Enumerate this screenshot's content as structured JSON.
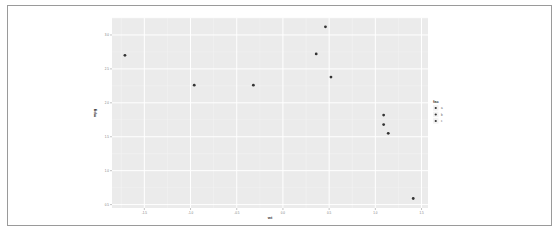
{
  "chart_data": {
    "type": "scatter",
    "title": "",
    "xlabel": "wt",
    "ylabel": "mpg",
    "xlim": [
      -1.85,
      1.57
    ],
    "ylim": [
      0.45,
      3.25
    ],
    "grid": true,
    "x_ticks": [
      -1.5,
      -1.0,
      -0.5,
      0.0,
      0.5,
      1.0,
      1.5
    ],
    "x_tick_labels": [
      "-1.5",
      "-1.0",
      "-0.5",
      "0.0",
      "0.5",
      "1.0",
      "1.5"
    ],
    "y_ticks": [
      0.5,
      1.0,
      1.5,
      2.0,
      2.5,
      3.0
    ],
    "y_tick_labels": [
      "0.5",
      "1.0",
      "1.5",
      "2.0",
      "2.5",
      "3.0"
    ],
    "legend": {
      "title": "fac",
      "placement": "right",
      "entries": [
        "a",
        "b",
        "c"
      ]
    },
    "points": [
      {
        "x": -1.71,
        "y": 2.7,
        "group": "a"
      },
      {
        "x": -0.96,
        "y": 2.26,
        "group": "a"
      },
      {
        "x": -0.32,
        "y": 2.26,
        "group": "a"
      },
      {
        "x": 0.36,
        "y": 2.72,
        "group": "a"
      },
      {
        "x": 0.46,
        "y": 3.12,
        "group": "b"
      },
      {
        "x": 0.52,
        "y": 2.38,
        "group": "a"
      },
      {
        "x": 1.09,
        "y": 1.82,
        "group": "a"
      },
      {
        "x": 1.09,
        "y": 1.68,
        "group": "a"
      },
      {
        "x": 1.14,
        "y": 1.55,
        "group": "b"
      },
      {
        "x": 1.41,
        "y": 0.59,
        "group": "c"
      }
    ],
    "colors": {
      "panel": "#ebebeb",
      "grid_major": "#ffffff",
      "grid_minor": "#f5f5f5",
      "point": "#333333"
    }
  }
}
